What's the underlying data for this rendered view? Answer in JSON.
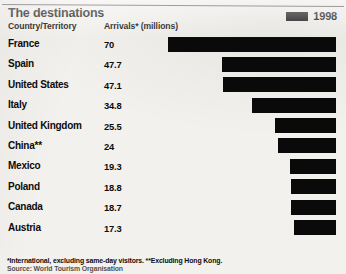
{
  "header": {
    "title": "The destinations",
    "column_country": "Country/Territory",
    "column_arrivals": "Arrivals* (millions)"
  },
  "legend": {
    "label": "1998",
    "swatch_color": "#0a0a0a",
    "swatch_icon": "legend-swatch-icon"
  },
  "footnotes": {
    "line1": "*International, excluding same-day visitors. **Excluding Hong Kong.",
    "line2": "Source: World Tourism Organisation"
  },
  "colors": {
    "background": "#f3f1ed",
    "ink": "#0c0c0c",
    "bar": "#0a0a0a"
  },
  "chart_data": {
    "type": "bar",
    "title": "The destinations",
    "xlabel": "Arrivals* (millions)",
    "ylabel": "Country/Territory",
    "orientation": "horizontal",
    "bar_alignment": "right-aligned",
    "grid": false,
    "legend_position": "top-right",
    "series_name": "1998",
    "xlim": [
      0,
      70
    ],
    "categories": [
      "France",
      "Spain",
      "United States",
      "Italy",
      "United Kingdom",
      "China**",
      "Mexico",
      "Poland",
      "Canada",
      "Austria"
    ],
    "values": [
      70,
      47.7,
      47.1,
      34.8,
      25.5,
      24,
      19.3,
      18.8,
      18.7,
      17.3
    ],
    "value_labels": [
      "70",
      "47.7",
      "47.1",
      "34.8",
      "25.5",
      "24",
      "19.3",
      "18.8",
      "18.7",
      "17.3"
    ]
  },
  "rows": [
    {
      "country": "France",
      "value": "70",
      "pct": 100.0
    },
    {
      "country": "Spain",
      "value": "47.7",
      "pct": 68.14
    },
    {
      "country": "United States",
      "value": "47.1",
      "pct": 67.29
    },
    {
      "country": "Italy",
      "value": "34.8",
      "pct": 49.71
    },
    {
      "country": "United Kingdom",
      "value": "25.5",
      "pct": 36.43
    },
    {
      "country": "China**",
      "value": "24",
      "pct": 34.29
    },
    {
      "country": "Mexico",
      "value": "19.3",
      "pct": 27.57
    },
    {
      "country": "Poland",
      "value": "18.8",
      "pct": 26.86
    },
    {
      "country": "Canada",
      "value": "18.7",
      "pct": 26.71
    },
    {
      "country": "Austria",
      "value": "17.3",
      "pct": 24.71
    }
  ]
}
